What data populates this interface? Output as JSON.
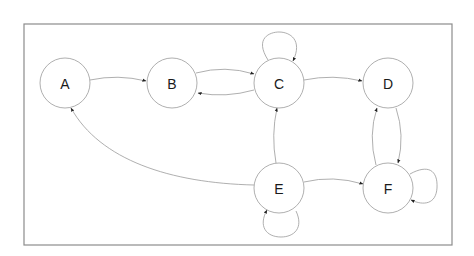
{
  "diagram": {
    "type": "directed-graph",
    "frame": {
      "x": 24,
      "y": 24,
      "width": 428,
      "height": 221,
      "stroke": "#8c8c8c"
    },
    "node_radius": 25,
    "nodes": [
      {
        "id": "A",
        "label": "A",
        "cx": 65,
        "cy": 83
      },
      {
        "id": "B",
        "label": "B",
        "cx": 172,
        "cy": 83
      },
      {
        "id": "C",
        "label": "C",
        "cx": 279,
        "cy": 83
      },
      {
        "id": "D",
        "label": "D",
        "cx": 388,
        "cy": 83
      },
      {
        "id": "E",
        "label": "E",
        "cx": 279,
        "cy": 188
      },
      {
        "id": "F",
        "label": "F",
        "cx": 388,
        "cy": 188
      }
    ],
    "edges": [
      {
        "from": "A",
        "to": "B"
      },
      {
        "from": "B",
        "to": "C"
      },
      {
        "from": "C",
        "to": "B"
      },
      {
        "from": "C",
        "to": "C"
      },
      {
        "from": "C",
        "to": "D"
      },
      {
        "from": "D",
        "to": "F"
      },
      {
        "from": "F",
        "to": "D"
      },
      {
        "from": "F",
        "to": "F"
      },
      {
        "from": "E",
        "to": "A"
      },
      {
        "from": "E",
        "to": "C"
      },
      {
        "from": "E",
        "to": "F"
      },
      {
        "from": "E",
        "to": "E"
      }
    ]
  }
}
